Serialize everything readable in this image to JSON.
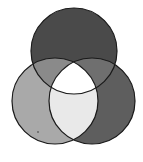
{
  "diagram": {
    "type": "venn-3",
    "background": "#ffffff",
    "stroke_color": "#1a1a1a",
    "stroke_width": 1.2,
    "circles": [
      {
        "id": "top",
        "cx": 74,
        "cy": 51,
        "r": 43
      },
      {
        "id": "left",
        "cx": 55,
        "cy": 101,
        "r": 43
      },
      {
        "id": "right",
        "cx": 92,
        "cy": 101,
        "r": 43
      }
    ],
    "regions": {
      "top_only": "#4a4a4a",
      "left_only": "#a9a9a9",
      "right_only": "#5e5e5e",
      "top_left": "#8a8a8a",
      "top_right": "#6f6f6f",
      "left_right": "#e9e9e9",
      "all_three": "#ffffff"
    },
    "artifact_dot": {
      "cx": 38,
      "cy": 132,
      "r": 0.8,
      "color": "#333333"
    }
  }
}
